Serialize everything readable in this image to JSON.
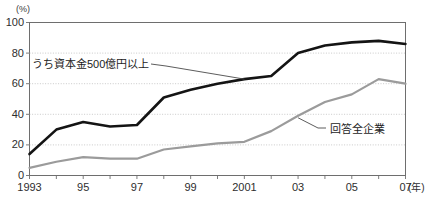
{
  "chart_data": {
    "type": "line",
    "title": "",
    "xlabel": "年",
    "ylabel": "(%)",
    "ylim": [
      0,
      100
    ],
    "yticks": [
      0,
      20,
      40,
      60,
      80,
      100
    ],
    "grid": true,
    "legend_position": "inline-annotation",
    "x": [
      1993,
      1994,
      1995,
      1996,
      1997,
      1998,
      1999,
      2000,
      2001,
      2002,
      2003,
      2004,
      2005,
      2006,
      2007
    ],
    "xtick_labels": [
      "1993",
      "",
      "95",
      "",
      "97",
      "",
      "99",
      "",
      "2001",
      "",
      "03",
      "",
      "05",
      "",
      "07"
    ],
    "series": [
      {
        "name": "うち資本金500億円以上",
        "color": "#141414",
        "values": [
          14,
          30,
          35,
          32,
          33,
          51,
          56,
          60,
          63,
          65,
          80,
          85,
          87,
          88,
          86
        ]
      },
      {
        "name": "回答全企業",
        "color": "#9b9b9b",
        "values": [
          5,
          9,
          12,
          11,
          11,
          17,
          19,
          21,
          22,
          29,
          39,
          48,
          53,
          63,
          60
        ]
      }
    ]
  },
  "axis": {
    "unit_top": "(%)",
    "unit_x": "(年)",
    "ytick_labels": [
      "100",
      "80",
      "60",
      "40",
      "20",
      "0"
    ]
  },
  "annotations": {
    "upper_series_label": "うち資本金500億円以上",
    "lower_series_label": "回答全企業"
  },
  "colors": {
    "upper_line": "#141414",
    "lower_line": "#9b9b9b",
    "grid": "#bdbdbd",
    "frame": "#6e6e6e",
    "text": "#2e2e2e"
  }
}
